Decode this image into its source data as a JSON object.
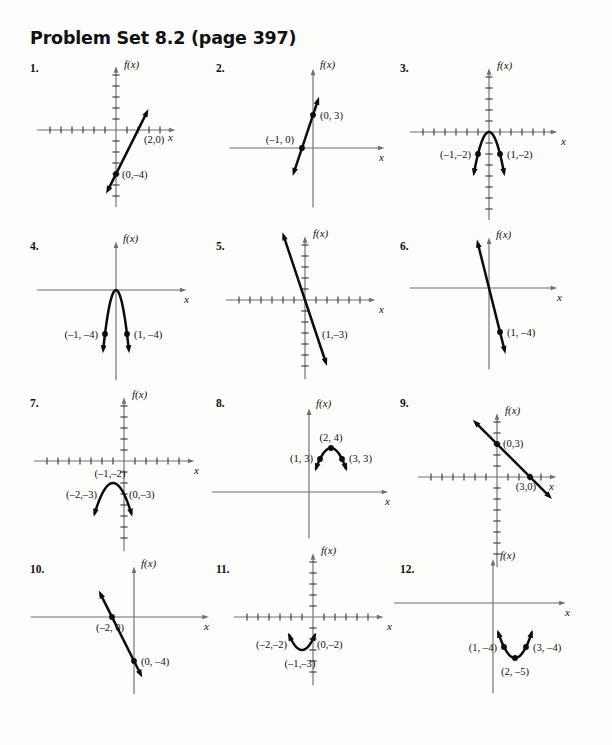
{
  "document": {
    "title": "Problem Set 8.2 (page 397)",
    "page_width": 612,
    "page_height": 745,
    "axis_label_y": "f(x)",
    "axis_label_x": "x"
  },
  "problems": [
    {
      "number": "1.",
      "num_x": 30,
      "num_y": 62,
      "origin_x": 116,
      "origin_y": 130,
      "box_x": 28,
      "box_y": 55,
      "unit": 11,
      "ticks": true,
      "tick_left": 6,
      "tick_right": 4,
      "tick_up": 5,
      "tick_down": 6,
      "ax_left": -7.2,
      "ax_right": 5.4,
      "ax_up": 5.8,
      "ax_down": -7.0,
      "type": "line",
      "line": {
        "slope": 2,
        "intercept": -4,
        "x_from": -0.9,
        "x_to": 2.95,
        "arrow_start": true,
        "arrow_end": true
      },
      "points": [
        {
          "x": 2,
          "y": 0,
          "dot": false,
          "label": "(2,0)",
          "lx": 6,
          "ly": 13,
          "anchor": "start"
        },
        {
          "x": 0,
          "y": -4,
          "dot": true,
          "label": "(0,–4)",
          "lx": 6,
          "ly": 4,
          "anchor": "start"
        }
      ],
      "flabel_dx": 8,
      "flabel_dy": -62,
      "xlabel_dx": 52,
      "xlabel_dy": 11
    },
    {
      "number": "2.",
      "num_x": 216,
      "num_y": 62,
      "origin_x": 313,
      "origin_y": 148,
      "box_x": 214,
      "box_y": 55,
      "unit": 11,
      "ticks": false,
      "tick_left": 0,
      "tick_right": 0,
      "tick_up": 0,
      "tick_down": 0,
      "ax_left": -7.6,
      "ax_right": 6.5,
      "ax_up": 7.2,
      "ax_down": -5.4,
      "type": "line",
      "line": {
        "slope": 3,
        "intercept": 3,
        "x_from": -1.85,
        "x_to": 0.55,
        "arrow_start": true,
        "arrow_end": true
      },
      "points": [
        {
          "x": -1,
          "y": 0,
          "dot": true,
          "label": "(–1, 0)",
          "lx": -8,
          "ly": -5,
          "anchor": "end"
        },
        {
          "x": 0,
          "y": 3,
          "dot": true,
          "label": "(0, 3)",
          "lx": 7,
          "ly": 4,
          "anchor": "start"
        }
      ],
      "flabel_dx": 7,
      "flabel_dy": -80,
      "xlabel_dx": 66,
      "xlabel_dy": 13
    },
    {
      "number": "3.",
      "num_x": 400,
      "num_y": 62,
      "origin_x": 489,
      "origin_y": 132,
      "box_x": 398,
      "box_y": 55,
      "unit": 11,
      "ticks": true,
      "tick_left": 6,
      "tick_right": 5,
      "tick_up": 5,
      "tick_down": 7,
      "ax_left": -7.2,
      "ax_right": 6.2,
      "ax_up": 5.8,
      "ax_down": -8.0,
      "type": "parabola",
      "parabola": {
        "a": -2,
        "h": 0,
        "k": 0,
        "x_from": -1.42,
        "x_to": 1.42,
        "arrow_start": true,
        "arrow_end": true
      },
      "points": [
        {
          "x": -1,
          "y": -2,
          "dot": true,
          "label": "(–1,–2)",
          "lx": -7,
          "ly": 4,
          "anchor": "end"
        },
        {
          "x": 1,
          "y": -2,
          "dot": true,
          "label": "(1,–2)",
          "lx": 7,
          "ly": 4,
          "anchor": "start"
        }
      ],
      "flabel_dx": 8,
      "flabel_dy": -63,
      "xlabel_dx": 72,
      "xlabel_dy": 13
    },
    {
      "number": "4.",
      "num_x": 30,
      "num_y": 240,
      "origin_x": 116,
      "origin_y": 290,
      "box_x": 28,
      "box_y": 233,
      "unit": 11,
      "ticks": false,
      "tick_left": 0,
      "tick_right": 0,
      "tick_up": 0,
      "tick_down": 0,
      "ax_left": -7.2,
      "ax_right": 6.4,
      "ax_up": 4.4,
      "ax_down": -8.2,
      "type": "parabola",
      "parabola": {
        "a": -4,
        "h": 0,
        "k": 0,
        "x_from": -1.2,
        "x_to": 1.2,
        "arrow_start": true,
        "arrow_end": true
      },
      "points": [
        {
          "x": -1,
          "y": -4,
          "dot": true,
          "label": "(–1, –4)",
          "lx": -7,
          "ly": 4,
          "anchor": "end"
        },
        {
          "x": 1,
          "y": -4,
          "dot": true,
          "label": "(1, –4)",
          "lx": 7,
          "ly": 4,
          "anchor": "start"
        }
      ],
      "flabel_dx": 7,
      "flabel_dy": -48,
      "xlabel_dx": 68,
      "xlabel_dy": 13
    },
    {
      "number": "5.",
      "num_x": 216,
      "num_y": 240,
      "origin_x": 305,
      "origin_y": 300,
      "box_x": 214,
      "box_y": 233,
      "unit": 11,
      "ticks": true,
      "tick_left": 6,
      "tick_right": 5,
      "tick_up": 5,
      "tick_down": 6,
      "ax_left": -7.2,
      "ax_right": 6.4,
      "ax_up": 5.8,
      "ax_down": -7.2,
      "type": "line",
      "line": {
        "slope": -3,
        "intercept": 0,
        "x_from": -2.05,
        "x_to": 2.0,
        "arrow_start": true,
        "arrow_end": true
      },
      "points": [
        {
          "x": 1,
          "y": -3,
          "dot": false,
          "label": "(1,–3)",
          "lx": 6,
          "ly": 5,
          "anchor": "start"
        }
      ],
      "flabel_dx": 8,
      "flabel_dy": -63,
      "xlabel_dx": 74,
      "xlabel_dy": 13
    },
    {
      "number": "6.",
      "num_x": 400,
      "num_y": 240,
      "origin_x": 489,
      "origin_y": 288,
      "box_x": 398,
      "box_y": 233,
      "unit": 11,
      "ticks": false,
      "tick_left": 0,
      "tick_right": 0,
      "tick_up": 0,
      "tick_down": 0,
      "ax_left": -7.2,
      "ax_right": 6.2,
      "ax_up": 4.6,
      "ax_down": -7.4,
      "type": "line",
      "line": {
        "slope": -4,
        "intercept": 0,
        "x_from": -1.1,
        "x_to": 1.5,
        "arrow_start": true,
        "arrow_end": true
      },
      "points": [
        {
          "x": 1,
          "y": -4,
          "dot": true,
          "label": "(1, –4)",
          "lx": 7,
          "ly": 4,
          "anchor": "start"
        }
      ],
      "flabel_dx": 7,
      "flabel_dy": -50,
      "xlabel_dx": 68,
      "xlabel_dy": 13
    },
    {
      "number": "7.",
      "num_x": 30,
      "num_y": 397,
      "origin_x": 124,
      "origin_y": 461,
      "box_x": 28,
      "box_y": 390,
      "unit": 11,
      "ticks": true,
      "tick_left": 7,
      "tick_right": 5,
      "tick_up": 5,
      "tick_down": 7,
      "ax_left": -8.2,
      "ax_right": 6.4,
      "ax_up": 5.8,
      "ax_down": -8.2,
      "type": "parabola",
      "parabola": {
        "a": -1,
        "h": -1,
        "k": -2,
        "x_from": -2.75,
        "x_to": 0.75,
        "arrow_start": true,
        "arrow_end": true
      },
      "points": [
        {
          "x": -1,
          "y": -2,
          "dot": false,
          "label": "(–1,–2)",
          "lx": -3,
          "ly": -6,
          "anchor": "middle"
        },
        {
          "x": -2,
          "y": -3,
          "dot": false,
          "label": "(–2,–3)",
          "lx": -5,
          "ly": 4,
          "anchor": "end"
        },
        {
          "x": 0,
          "y": -3,
          "dot": false,
          "label": "(0,–3)",
          "lx": 5,
          "ly": 4,
          "anchor": "start"
        }
      ],
      "flabel_dx": 8,
      "flabel_dy": -63,
      "xlabel_dx": 70,
      "xlabel_dy": 13
    },
    {
      "number": "8.",
      "num_x": 216,
      "num_y": 397,
      "origin_x": 309,
      "origin_y": 492,
      "box_x": 214,
      "box_y": 390,
      "unit": 11,
      "ticks": false,
      "tick_left": 0,
      "tick_right": 0,
      "tick_up": 0,
      "tick_down": 0,
      "ax_left": -8.8,
      "ax_right": 7.2,
      "ax_up": 7.6,
      "ax_down": -4.2,
      "type": "parabola",
      "parabola": {
        "a": -1,
        "h": 2,
        "k": 4,
        "x_from": 0.55,
        "x_to": 3.45,
        "arrow_start": true,
        "arrow_end": true
      },
      "points": [
        {
          "x": 2,
          "y": 4,
          "dot": true,
          "label": "(2, 4)",
          "lx": 0,
          "ly": -7,
          "anchor": "middle"
        },
        {
          "x": 1,
          "y": 3,
          "dot": true,
          "label": "(1, 3)",
          "lx": -7,
          "ly": 3,
          "anchor": "end"
        },
        {
          "x": 3,
          "y": 3,
          "dot": true,
          "label": "(3, 3)",
          "lx": 7,
          "ly": 3,
          "anchor": "start"
        }
      ],
      "flabel_dx": 7,
      "flabel_dy": -85,
      "xlabel_dx": 76,
      "xlabel_dy": 13
    },
    {
      "number": "9.",
      "num_x": 400,
      "num_y": 397,
      "origin_x": 497,
      "origin_y": 477,
      "box_x": 398,
      "box_y": 390,
      "unit": 11,
      "ticks": true,
      "tick_left": 6,
      "tick_right": 4,
      "tick_up": 5,
      "tick_down": 7,
      "ax_left": -7.2,
      "ax_right": 5.4,
      "ax_up": 5.8,
      "ax_down": -8.2,
      "type": "line",
      "line": {
        "slope": -1,
        "intercept": 3,
        "x_from": -2.2,
        "x_to": 5.0,
        "arrow_start": true,
        "arrow_end": true
      },
      "points": [
        {
          "x": 0,
          "y": 3,
          "dot": true,
          "label": "(0,3)",
          "lx": 6,
          "ly": 3,
          "anchor": "start"
        },
        {
          "x": 3,
          "y": 0,
          "dot": true,
          "label": "(3,0)",
          "lx": -4,
          "ly": 13,
          "anchor": "middle"
        }
      ],
      "flabel_dx": 8,
      "flabel_dy": -63,
      "xlabel_dx": 52,
      "xlabel_dy": 13
    },
    {
      "number": "10.",
      "num_x": 30,
      "num_y": 563,
      "origin_x": 134,
      "origin_y": 617,
      "box_x": 28,
      "box_y": 556,
      "unit": 11,
      "ticks": false,
      "tick_left": 0,
      "tick_right": 0,
      "tick_up": 0,
      "tick_down": 0,
      "ax_left": -9.4,
      "ax_right": 6.8,
      "ax_up": 4.6,
      "ax_down": -7.0,
      "type": "line",
      "line": {
        "slope": -2,
        "intercept": -4,
        "x_from": -3.2,
        "x_to": 0.75,
        "arrow_start": true,
        "arrow_end": true
      },
      "points": [
        {
          "x": -2,
          "y": 0,
          "dot": true,
          "label": "(–2, 0)",
          "lx": -2,
          "ly": 14,
          "anchor": "middle"
        },
        {
          "x": 0,
          "y": -4,
          "dot": true,
          "label": "(0, –4)",
          "lx": 7,
          "ly": 4,
          "anchor": "start"
        }
      ],
      "flabel_dx": 7,
      "flabel_dy": -50,
      "xlabel_dx": 70,
      "xlabel_dy": 13
    },
    {
      "number": "11.",
      "num_x": 216,
      "num_y": 563,
      "origin_x": 313,
      "origin_y": 617,
      "box_x": 214,
      "box_y": 556,
      "unit": 11,
      "ticks": true,
      "tick_left": 6,
      "tick_right": 5,
      "tick_up": 5,
      "tick_down": 5,
      "ax_left": -7.2,
      "ax_right": 6.4,
      "ax_up": 5.8,
      "ax_down": -6.2,
      "type": "parabola",
      "parabola": {
        "a": 1,
        "h": -1,
        "k": -3,
        "x_from": -2.25,
        "x_to": 0.25,
        "arrow_start": true,
        "arrow_end": true
      },
      "points": [
        {
          "x": -2,
          "y": -2,
          "dot": false,
          "label": "(–2,–2)",
          "lx": -4,
          "ly": 9,
          "anchor": "end"
        },
        {
          "x": 0,
          "y": -2,
          "dot": false,
          "label": "(0,–2)",
          "lx": 4,
          "ly": 9,
          "anchor": "start"
        },
        {
          "x": -1,
          "y": -3,
          "dot": false,
          "label": "(–1,–3)",
          "lx": -2,
          "ly": 17,
          "anchor": "middle"
        }
      ],
      "flabel_dx": 8,
      "flabel_dy": -63,
      "xlabel_dx": 74,
      "xlabel_dy": 13
    },
    {
      "number": "12.",
      "num_x": 400,
      "num_y": 563,
      "origin_x": 493,
      "origin_y": 603,
      "box_x": 398,
      "box_y": 556,
      "unit": 11,
      "ticks": false,
      "tick_left": 0,
      "tick_right": 0,
      "tick_up": 0,
      "tick_down": 0,
      "ax_left": -9.0,
      "ax_right": 6.6,
      "ax_up": 4.0,
      "ax_down": -8.2,
      "type": "parabola",
      "parabola": {
        "a": 1,
        "h": 2,
        "k": -5,
        "x_from": 0.4,
        "x_to": 3.6,
        "arrow_start": true,
        "arrow_end": true
      },
      "points": [
        {
          "x": 1,
          "y": -4,
          "dot": true,
          "label": "(1, –4)",
          "lx": -7,
          "ly": 4,
          "anchor": "end"
        },
        {
          "x": 3,
          "y": -4,
          "dot": true,
          "label": "(3, –4)",
          "lx": 7,
          "ly": 4,
          "anchor": "start"
        },
        {
          "x": 2,
          "y": -5,
          "dot": true,
          "label": "(2, –5)",
          "lx": 0,
          "ly": 17,
          "anchor": "middle"
        }
      ],
      "flabel_dx": 7,
      "flabel_dy": -44,
      "xlabel_dx": 72,
      "xlabel_dy": 13
    }
  ],
  "chart_data": {
    "type": "line",
    "title": "Problem Set 8.2 (page 397)",
    "xlabel": "x",
    "ylabel": "f(x)",
    "graphs": [
      {
        "id": 1,
        "kind": "line",
        "slope": 2,
        "intercept": -4,
        "labeled_points": [
          [
            2,
            0
          ],
          [
            0,
            -4
          ]
        ]
      },
      {
        "id": 2,
        "kind": "line",
        "slope": 3,
        "intercept": 3,
        "labeled_points": [
          [
            -1,
            0
          ],
          [
            0,
            3
          ]
        ]
      },
      {
        "id": 3,
        "kind": "parabola",
        "a": -2,
        "vertex": [
          0,
          0
        ],
        "labeled_points": [
          [
            -1,
            -2
          ],
          [
            1,
            -2
          ]
        ]
      },
      {
        "id": 4,
        "kind": "parabola",
        "a": -4,
        "vertex": [
          0,
          0
        ],
        "labeled_points": [
          [
            -1,
            -4
          ],
          [
            1,
            -4
          ]
        ]
      },
      {
        "id": 5,
        "kind": "line",
        "slope": -3,
        "intercept": 0,
        "labeled_points": [
          [
            1,
            -3
          ]
        ]
      },
      {
        "id": 6,
        "kind": "line",
        "slope": -4,
        "intercept": 0,
        "labeled_points": [
          [
            1,
            -4
          ]
        ]
      },
      {
        "id": 7,
        "kind": "parabola",
        "a": -1,
        "vertex": [
          -1,
          -2
        ],
        "labeled_points": [
          [
            -2,
            -3
          ],
          [
            -1,
            -2
          ],
          [
            0,
            -3
          ]
        ]
      },
      {
        "id": 8,
        "kind": "parabola",
        "a": -1,
        "vertex": [
          2,
          4
        ],
        "labeled_points": [
          [
            1,
            3
          ],
          [
            2,
            4
          ],
          [
            3,
            3
          ]
        ]
      },
      {
        "id": 9,
        "kind": "line",
        "slope": -1,
        "intercept": 3,
        "labeled_points": [
          [
            0,
            3
          ],
          [
            3,
            0
          ]
        ]
      },
      {
        "id": 10,
        "kind": "line",
        "slope": -2,
        "intercept": -4,
        "labeled_points": [
          [
            -2,
            0
          ],
          [
            0,
            -4
          ]
        ]
      },
      {
        "id": 11,
        "kind": "parabola",
        "a": 1,
        "vertex": [
          -1,
          -3
        ],
        "labeled_points": [
          [
            -2,
            -2
          ],
          [
            -1,
            -3
          ],
          [
            0,
            -2
          ]
        ]
      },
      {
        "id": 12,
        "kind": "parabola",
        "a": 1,
        "vertex": [
          2,
          -5
        ],
        "labeled_points": [
          [
            1,
            -4
          ],
          [
            2,
            -5
          ],
          [
            3,
            -4
          ]
        ]
      }
    ]
  }
}
